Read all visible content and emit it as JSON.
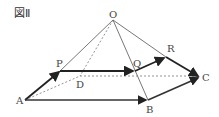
{
  "figure": {
    "title": "図Ⅱ",
    "labels": {
      "O": "O",
      "P": "P",
      "Q": "Q",
      "R": "R",
      "A": "A",
      "B": "B",
      "C": "C",
      "D": "D"
    }
  }
}
